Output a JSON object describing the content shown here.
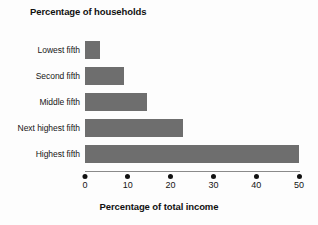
{
  "chart_data": {
    "type": "bar",
    "orientation": "horizontal",
    "title": "Percentage of households",
    "categories": [
      "Lowest fifth",
      "Second fifth",
      "Middle fifth",
      "Next highest fifth",
      "Highest fifth"
    ],
    "values": [
      3.5,
      9,
      14.5,
      23,
      50
    ],
    "xlabel": "Percentage of total income",
    "ylabel": "Percentage of households",
    "xlim": [
      0,
      50
    ],
    "xticks": [
      "0",
      "10",
      "20",
      "30",
      "40",
      "50"
    ],
    "xtick_values": [
      0,
      10,
      20,
      30,
      40,
      50
    ],
    "grid": false,
    "legend": false,
    "series": [
      {
        "name": "Percentage of total income",
        "values": [
          3.5,
          9,
          14.5,
          23,
          50
        ]
      }
    ]
  },
  "style": {
    "bar_color": "#6e6e6e",
    "background": "#fdfdfd",
    "text_color": "#141414",
    "axis_color": "#8a8a8a"
  }
}
